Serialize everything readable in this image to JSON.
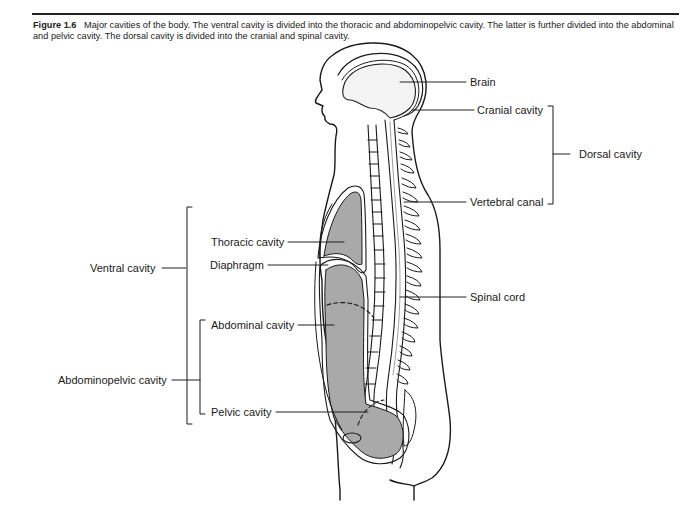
{
  "figure": {
    "number": "Figure 1.6",
    "caption": "Major cavities of the body. The ventral cavity is divided into the thoracic and abdominopelvic cavity. The latter is further divided into the abdominal and pelvic cavity. The dorsal cavity is divided into the cranial and spinal cavity."
  },
  "labels": {
    "brain": "Brain",
    "cranial_cavity": "Cranial cavity",
    "dorsal_cavity": "Dorsal cavity",
    "vertebral_canal": "Vertebral canal",
    "thoracic_cavity": "Thoracic cavity",
    "diaphragm": "Diaphragm",
    "ventral_cavity": "Ventral cavity",
    "spinal_cord": "Spinal cord",
    "abdominal_cavity": "Abdominal cavity",
    "abdominopelvic_cavity": "Abdominopelvic cavity",
    "pelvic_cavity": "Pelvic cavity"
  },
  "colors": {
    "cavity_fill": "#a9a9a9",
    "brain_fill": "#f3f3f3",
    "line": "#1a1a1a"
  }
}
